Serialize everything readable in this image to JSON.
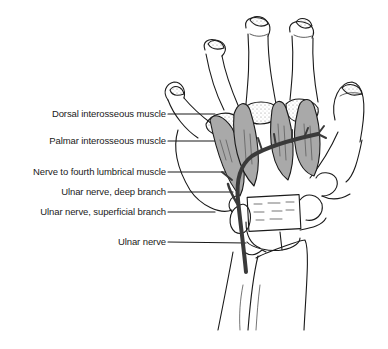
{
  "figure": {
    "labels": [
      {
        "id": "dorsal",
        "text": "Dorsal interosseous muscle",
        "y": 108
      },
      {
        "id": "palmar",
        "text": "Palmar interosseous muscle",
        "y": 135
      },
      {
        "id": "lumbrical",
        "text": "Nerve to fourth lumbrical muscle",
        "y": 166
      },
      {
        "id": "deep",
        "text": "Ulnar nerve, deep branch",
        "y": 186
      },
      {
        "id": "superficial",
        "text": "Ulnar nerve, superficial branch",
        "y": 206
      },
      {
        "id": "ulnar",
        "text": "Ulnar nerve",
        "y": 236
      }
    ],
    "colors": {
      "line": "#1a1a1a",
      "muscle_fill": "#a9a9a9",
      "nerve": "#3a3a3a",
      "background": "#ffffff"
    }
  }
}
